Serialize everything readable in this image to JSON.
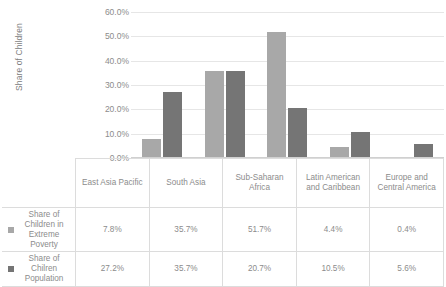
{
  "chart_data": {
    "type": "bar",
    "title": "",
    "xlabel": "",
    "ylabel": "Share of Children",
    "ylim": [
      0,
      60
    ],
    "ytick_labels": [
      "60.0%",
      "50.0%",
      "40.0%",
      "30.0%",
      "20.0%",
      "10.0%",
      "0.0%"
    ],
    "ytick_values": [
      60,
      50,
      40,
      30,
      20,
      10,
      0
    ],
    "grid": true,
    "legend_position": "data-table-left",
    "categories": [
      "East Asia Pacific",
      "South Asia",
      "Sub-Saharan Africa",
      "Latin American and Caribbean",
      "Europe and Central America"
    ],
    "series": [
      {
        "name": "Share of Children in Extreme Poverty",
        "color": "#a8a8a8",
        "values": [
          7.8,
          35.7,
          51.7,
          4.4,
          0.4
        ],
        "value_labels": [
          "7.8%",
          "35.7%",
          "51.7%",
          "4.4%",
          "0.4%"
        ]
      },
      {
        "name": "Share of Chilren Population",
        "color": "#757575",
        "values": [
          27.2,
          35.7,
          20.7,
          10.5,
          5.6
        ],
        "value_labels": [
          "27.2%",
          "35.7%",
          "20.7%",
          "10.5%",
          "5.6%"
        ]
      }
    ]
  }
}
